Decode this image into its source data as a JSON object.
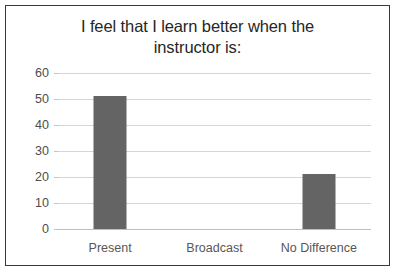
{
  "chart_data": {
    "type": "bar",
    "title": "I feel that I learn better when the instructor is:",
    "title_lines": [
      "I feel that I learn better when the",
      "instructor is:"
    ],
    "categories": [
      "Present",
      "Broadcast",
      "No Difference"
    ],
    "values": [
      51,
      0,
      21
    ],
    "xlabel": "",
    "ylabel": "",
    "ylim": [
      0,
      60
    ],
    "yticks": [
      0,
      10,
      20,
      30,
      40,
      50,
      60
    ],
    "ytick_labels": [
      "0",
      "10",
      "20",
      "30",
      "40",
      "50",
      "60"
    ],
    "grid": true,
    "legend": false,
    "bar_color": "#646464",
    "gridline_color": "#d6d6d6",
    "axis_text_color": "#575757",
    "title_color": "#262626",
    "border_color": "#3a3a3a",
    "background_color": "#ffffff"
  }
}
